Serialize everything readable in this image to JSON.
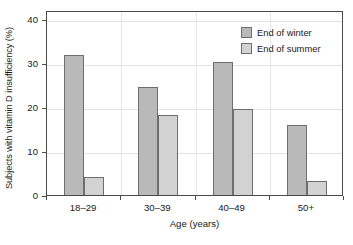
{
  "chart_data": {
    "type": "bar",
    "title": "",
    "xlabel": "Age (years)",
    "ylabel": "Subjects with vitamin D insufficiency (%)",
    "categories": [
      "18–29",
      "30–39",
      "40–49",
      "50+"
    ],
    "series": [
      {
        "name": "End of winter",
        "color": "#b9b9b9",
        "values": [
          31.7,
          24.6,
          30.1,
          15.8
        ]
      },
      {
        "name": "End of summer",
        "color": "#d2d2d2",
        "values": [
          4.0,
          18.2,
          19.5,
          3.2
        ]
      }
    ],
    "ylim": [
      0,
      42
    ],
    "yticks": [
      0,
      10,
      20,
      30,
      40
    ],
    "ytick_labels": [
      "0",
      "10",
      "20",
      "30",
      "40"
    ],
    "grid": "both",
    "legend_position": "top-right",
    "axis_color": "#4a4a4a",
    "bar_edge_color": "#6e6e6e",
    "gridline_color": "#e2e2e2"
  }
}
